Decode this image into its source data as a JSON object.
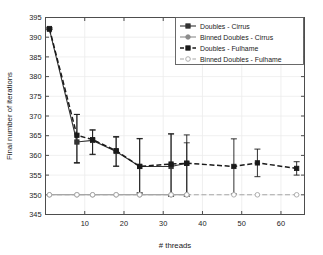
{
  "chart_data": {
    "type": "line",
    "title": "",
    "xlabel": "# threads",
    "ylabel": "Final number of iterations",
    "xlim": [
      0,
      66
    ],
    "ylim": [
      345,
      395
    ],
    "xticks": [
      10,
      20,
      30,
      40,
      50,
      60
    ],
    "yticks": [
      345,
      350,
      355,
      360,
      365,
      370,
      375,
      380,
      385,
      390,
      395
    ],
    "grid": true,
    "legend_position": "top-right",
    "series": [
      {
        "name": "Doubles - Cirrus",
        "color": "#333333",
        "linestyle": "solid",
        "marker": "square",
        "x": [
          1,
          8,
          12,
          18,
          24,
          32,
          36
        ],
        "values": [
          392.0,
          363.4,
          363.8,
          361.0,
          357.2,
          357.2,
          358.0
        ],
        "err_low": [
          392.0,
          358.0,
          360.2,
          357.2,
          350.4,
          349.6,
          349.6
        ],
        "err_high": [
          392.3,
          370.4,
          366.4,
          364.6,
          364.2,
          365.4,
          363.2
        ]
      },
      {
        "name": "Binned Doubles - Cirrus",
        "color": "#8c8c8c",
        "linestyle": "solid",
        "marker": "circle",
        "x": [
          1,
          8,
          12,
          18,
          24,
          32,
          36
        ],
        "values": [
          350,
          350,
          350,
          350,
          350,
          350,
          350
        ],
        "err_low": [
          350,
          350,
          350,
          350,
          350,
          350,
          350
        ],
        "err_high": [
          350,
          350,
          350,
          350,
          350,
          350,
          350
        ]
      },
      {
        "name": "Doubles - Fulhame",
        "color": "#1a1a1a",
        "linestyle": "dashed",
        "marker": "square",
        "x": [
          1,
          8,
          12,
          18,
          24,
          32,
          36,
          48,
          54,
          64
        ],
        "values": [
          392.2,
          365.1,
          364.0,
          361.2,
          357.2,
          357.8,
          358.0,
          357.2,
          358.1,
          356.7
        ],
        "err_low": [
          392.0,
          358.2,
          360.3,
          357.3,
          350.5,
          349.8,
          350.0,
          350.2,
          354.6,
          355.0
        ],
        "err_high": [
          392.4,
          370.4,
          366.5,
          364.8,
          364.3,
          365.5,
          365.2,
          364.2,
          361.6,
          358.4
        ]
      },
      {
        "name": "Binned Doubles - Fulhame",
        "color": "#a6a6a6",
        "linestyle": "dashed",
        "marker": "circle-open",
        "x": [
          1,
          8,
          12,
          18,
          24,
          32,
          36,
          48,
          54,
          64
        ],
        "values": [
          350,
          350,
          350,
          350,
          350,
          350,
          350,
          350,
          350,
          350
        ],
        "err_low": [
          350,
          350,
          350,
          350,
          350,
          350,
          350,
          350,
          350,
          350
        ],
        "err_high": [
          350,
          350,
          350,
          350,
          350,
          350,
          350,
          350,
          350,
          350
        ]
      }
    ]
  },
  "axes": {
    "xlabel": "# threads",
    "ylabel": "Final number of iterations"
  },
  "legend": {
    "items": [
      {
        "label": "Doubles - Cirrus"
      },
      {
        "label": "Binned Doubles - Cirrus"
      },
      {
        "label": "Doubles - Fulhame"
      },
      {
        "label": "Binned Doubles - Fulhame"
      }
    ]
  },
  "colors": {
    "axis": "#4d4d4d",
    "grid": "#ececec",
    "background": "#ffffff",
    "dark_series": "#1a1a1a",
    "gray_series": "#909090"
  }
}
